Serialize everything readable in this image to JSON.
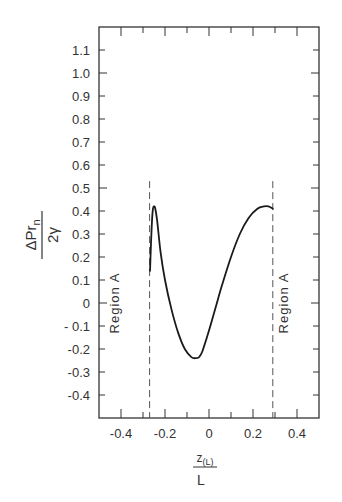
{
  "chart_data": {
    "type": "line",
    "title": "",
    "xlabel": "z(L) / L",
    "xlabel_parts": {
      "numerator": "z",
      "numerator_sub": "(L)",
      "denominator": "L"
    },
    "ylabel": "ΔPr_n / 2γ",
    "ylabel_parts": {
      "numerator": "ΔPr",
      "numerator_sub": "n",
      "denominator": "2γ"
    },
    "xlim": [
      -0.5,
      0.5
    ],
    "ylim": [
      -0.5,
      1.2
    ],
    "grid": false,
    "legend": null,
    "x_ticks": [
      -0.4,
      -0.2,
      0,
      0.2,
      0.4
    ],
    "x_tick_labels": [
      "-0.4",
      "-0.2",
      "0",
      "0.2",
      "0.4"
    ],
    "x_minor_ticks": [
      -0.3,
      -0.1,
      0.1,
      0.3
    ],
    "y_ticks": [
      1.1,
      1.0,
      0.9,
      0.8,
      0.7,
      0.6,
      0.5,
      0.4,
      0.3,
      0.2,
      0.1,
      0,
      -0.1,
      -0.2,
      -0.3,
      -0.4
    ],
    "y_tick_labels": [
      "1.1",
      "1.0",
      "0.9",
      "0.8",
      "0.7",
      "0.6",
      "0.5",
      "0.4",
      "0.3",
      "0.2",
      "0.1",
      "0",
      "- 0.1",
      "-0.2",
      "-0.3",
      "-0.4"
    ],
    "series": [
      {
        "name": "ΔPr_n / 2γ",
        "x": [
          -0.268,
          -0.262,
          -0.256,
          -0.25,
          -0.244,
          -0.236,
          -0.22,
          -0.2,
          -0.17,
          -0.14,
          -0.11,
          -0.08,
          -0.06,
          -0.045,
          -0.03,
          0.0,
          0.03,
          0.06,
          0.1,
          0.14,
          0.18,
          0.22,
          0.25,
          0.27,
          0.29
        ],
        "y": [
          0.14,
          0.3,
          0.4,
          0.42,
          0.41,
          0.36,
          0.22,
          0.1,
          -0.03,
          -0.13,
          -0.2,
          -0.235,
          -0.24,
          -0.235,
          -0.21,
          -0.12,
          -0.02,
          0.08,
          0.2,
          0.3,
          0.37,
          0.41,
          0.42,
          0.42,
          0.41
        ]
      }
    ],
    "vertical_dashed_lines": [
      {
        "x": -0.27,
        "y_top": 0.53
      },
      {
        "x": 0.29,
        "y_top": 0.53
      }
    ],
    "annotations": [
      {
        "text": "Region A",
        "x": -0.41,
        "y": 0.0,
        "rotation": -90
      },
      {
        "text": "Region A",
        "x": 0.36,
        "y": 0.0,
        "rotation": -90
      }
    ]
  },
  "colors": {
    "line": "#1a1a1a",
    "axis": "#333333",
    "dashed": "#555555",
    "background": "#ffffff"
  }
}
